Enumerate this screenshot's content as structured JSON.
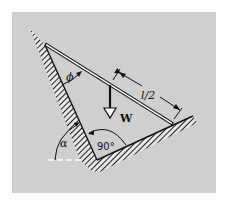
{
  "diagram": {
    "title": "",
    "background_color": "#cfcfcf",
    "labels": {
      "phi": "ϕ",
      "half_length": "l/2",
      "weight": "W",
      "alpha": "α",
      "right_angle": "90°"
    },
    "elements": [
      {
        "id": "left-wall",
        "type": "hatched-wall",
        "from": [
          45,
          45
        ],
        "to": [
          97,
          160
        ]
      },
      {
        "id": "right-wall",
        "type": "hatched-wall",
        "from": [
          97,
          160
        ],
        "to": [
          180,
          120
        ]
      },
      {
        "id": "rod",
        "type": "rod",
        "from": [
          45,
          45
        ],
        "to": [
          172,
          124
        ]
      },
      {
        "id": "weight",
        "type": "force-arrow",
        "at": [
          110,
          85
        ],
        "label": "W"
      },
      {
        "id": "dimension-l2",
        "type": "dimension",
        "label": "l/2"
      },
      {
        "id": "angle-phi",
        "type": "angle",
        "label": "ϕ"
      },
      {
        "id": "angle-alpha",
        "type": "angle",
        "label": "α"
      },
      {
        "id": "angle-90",
        "type": "angle",
        "label": "90°"
      }
    ]
  }
}
